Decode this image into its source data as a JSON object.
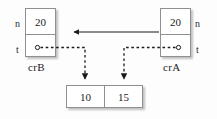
{
  "diagram": {
    "background": "#fdfdfd",
    "line_color": "#1a1a1a",
    "border_color": "#8f8f8f",
    "nodes": [
      {
        "id": "crB",
        "name_label": "crB",
        "field_n_label": "n",
        "field_n_value": "20",
        "field_t_label": "t",
        "field_t_value": "",
        "label_side": "left"
      },
      {
        "id": "crA",
        "name_label": "crA",
        "field_n_label": "n",
        "field_n_value": "20",
        "field_t_label": "t",
        "field_t_value": "",
        "label_side": "right"
      }
    ],
    "array": {
      "cells": [
        "10",
        "15"
      ]
    },
    "edges": [
      {
        "id": "n-pointer",
        "from": "crA.n",
        "to": "crB",
        "style": "solid",
        "direction": "left"
      },
      {
        "id": "t-pointer-b",
        "from": "crB.t",
        "to": "array.cell0",
        "style": "dashed",
        "direction": "down"
      },
      {
        "id": "t-pointer-a",
        "from": "crA.t",
        "to": "array.cell1",
        "style": "dashed",
        "direction": "down"
      }
    ]
  }
}
